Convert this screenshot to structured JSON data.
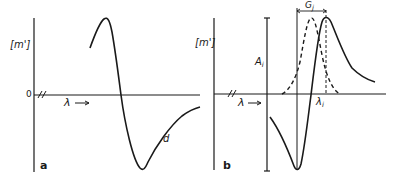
{
  "figure": {
    "panels": [
      {
        "id": "a",
        "panel_label": "a",
        "y_axis_label": "[m']",
        "zero_label": "0",
        "axis_break": "//",
        "x_axis_label": "λ →",
        "curve_label": "d"
      },
      {
        "id": "b",
        "panel_label": "b",
        "y_axis_label": "[m']",
        "axis_break": "//",
        "x_axis_label": "λ →",
        "amplitude_label": "A",
        "amplitude_sub": "i",
        "width_label": "G",
        "width_sub": "j",
        "peak_label": "λ",
        "peak_sub": "i"
      }
    ],
    "colors": {
      "ink": "#1a1a1a",
      "background": "#ffffff"
    }
  }
}
